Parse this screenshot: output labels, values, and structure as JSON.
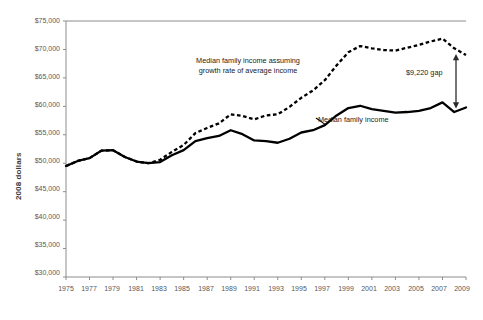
{
  "chart_data": {
    "type": "line",
    "title": "",
    "xlabel": "",
    "ylabel": "2008 dollars",
    "xlim": [
      1975,
      2009
    ],
    "ylim": [
      30000,
      75000
    ],
    "grid": false,
    "legend_position": "inline-annotations",
    "ytick_labels": [
      "$75,000",
      "$70,000",
      "$65,000",
      "$60,000",
      "$55,000",
      "$50,000",
      "$45,000",
      "$40,000",
      "$35,000",
      "$30,000"
    ],
    "ytick_values": [
      75000,
      70000,
      65000,
      60000,
      55000,
      50000,
      45000,
      40000,
      35000,
      30000
    ],
    "xtick_labels": [
      "1975",
      "1977",
      "1979",
      "1981",
      "1983",
      "1985",
      "1987",
      "1989",
      "1991",
      "1993",
      "1995",
      "1997",
      "1999",
      "2001",
      "2003",
      "2005",
      "2007",
      "2009"
    ],
    "xtick_values": [
      1975,
      1977,
      1979,
      1981,
      1983,
      1985,
      1987,
      1989,
      1991,
      1993,
      1995,
      1997,
      1999,
      2001,
      2003,
      2005,
      2007,
      2009
    ],
    "x": [
      1975,
      1976,
      1977,
      1978,
      1979,
      1980,
      1981,
      1982,
      1983,
      1984,
      1985,
      1986,
      1987,
      1988,
      1989,
      1990,
      1991,
      1992,
      1993,
      1994,
      1995,
      1996,
      1997,
      1998,
      1999,
      2000,
      2001,
      2002,
      2003,
      2004,
      2005,
      2006,
      2007,
      2008,
      2009
    ],
    "series": [
      {
        "name": "Median family income",
        "style": "solid",
        "color": "#000000",
        "values": [
          49500,
          50400,
          50900,
          52200,
          52300,
          51100,
          50300,
          50000,
          50200,
          51400,
          52300,
          53900,
          54400,
          54800,
          55800,
          55100,
          54000,
          53900,
          53600,
          54300,
          55400,
          55800,
          56700,
          58400,
          59700,
          60100,
          59500,
          59200,
          58900,
          59000,
          59200,
          59700,
          60700,
          59000,
          59800
        ]
      },
      {
        "name": "Median family income assuming growth rate of average income",
        "style": "dashed",
        "color": "#000000",
        "values": [
          49500,
          50400,
          50900,
          52200,
          52300,
          51100,
          50300,
          50000,
          50600,
          52000,
          53200,
          55300,
          56200,
          57000,
          58600,
          58300,
          57700,
          58400,
          58600,
          59900,
          61500,
          62800,
          64600,
          67200,
          69500,
          70600,
          70200,
          69900,
          69800,
          70300,
          70800,
          71400,
          71900,
          70200,
          69020
        ]
      }
    ],
    "annotations": [
      {
        "id": "dashed-series-label",
        "text_line1": "Median family income assuming",
        "text_line2": "growth rate of average income"
      },
      {
        "id": "solid-series-label",
        "text": "Median family income"
      },
      {
        "id": "gap-label",
        "text": "$9,220 gap",
        "value": 9220,
        "at_year": 2009,
        "arrow": "double-headed-vertical"
      }
    ]
  }
}
